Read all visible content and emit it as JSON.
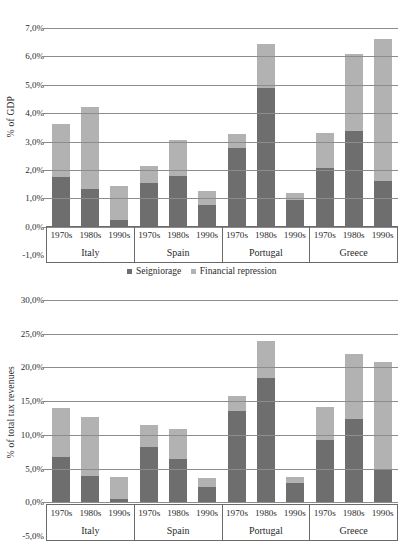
{
  "legend": {
    "items": [
      {
        "label": "Seigniorage",
        "color": "#6e6e6e",
        "key": "seigniorage"
      },
      {
        "label": "Financial repression",
        "color": "#b2b2b2",
        "key": "financial_repression"
      }
    ]
  },
  "axis_groups": {
    "countries": [
      "Italy",
      "Spain",
      "Portugal",
      "Greece"
    ],
    "periods": [
      "1970s",
      "1980s",
      "1990s"
    ]
  },
  "chart_data": [
    {
      "id": "gdp-chart",
      "type": "bar",
      "stacked": true,
      "title": "",
      "xlabel": "",
      "ylabel": "% of GDP",
      "ylim": [
        -1.0,
        7.0
      ],
      "ytick_step": 1.0,
      "ytick_labels": [
        "7,0%",
        "6,0%",
        "5,0%",
        "4,0%",
        "3,0%",
        "2,0%",
        "1,0%",
        "0,0%",
        "-1,0%"
      ],
      "ytick_values": [
        7.0,
        6.0,
        5.0,
        4.0,
        3.0,
        2.0,
        1.0,
        0.0,
        -1.0
      ],
      "grid": true,
      "legend_position": "bottom",
      "categories": [
        "Italy 1970s",
        "Italy 1980s",
        "Italy 1990s",
        "Spain 1970s",
        "Spain 1980s",
        "Spain 1990s",
        "Portugal 1970s",
        "Portugal 1980s",
        "Portugal 1990s",
        "Greece 1970s",
        "Greece 1980s",
        "Greece 1990s"
      ],
      "series": [
        {
          "name": "Seigniorage",
          "color": "#6e6e6e",
          "values": [
            1.75,
            1.32,
            0.22,
            1.55,
            1.77,
            0.76,
            2.78,
            4.9,
            1.18,
            2.08,
            3.38,
            1.6
          ]
        },
        {
          "name": "Financial repression",
          "color": "#b2b2b2",
          "values": [
            1.87,
            2.88,
            1.2,
            0.58,
            1.28,
            0.48,
            0.5,
            1.52,
            -0.25,
            1.22,
            2.7,
            5.0
          ]
        }
      ],
      "totals": [
        3.62,
        4.2,
        1.42,
        2.13,
        3.05,
        1.24,
        3.28,
        6.42,
        0.93,
        3.3,
        6.08,
        6.6
      ]
    },
    {
      "id": "tax-revenues-chart",
      "type": "bar",
      "stacked": true,
      "title": "",
      "xlabel": "",
      "ylabel": "% of total tax revenues",
      "ylim": [
        -5.0,
        30.0
      ],
      "ytick_step": 5.0,
      "ytick_labels": [
        "30,0%",
        "25,0%",
        "20,0%",
        "15,0%",
        "10,0%",
        "5,0%",
        "0,0%",
        "-5,0%"
      ],
      "ytick_values": [
        30.0,
        25.0,
        20.0,
        15.0,
        10.0,
        5.0,
        0.0,
        -5.0
      ],
      "grid": true,
      "legend_position": "none",
      "categories": [
        "Italy 1970s",
        "Italy 1980s",
        "Italy 1990s",
        "Spain 1970s",
        "Spain 1980s",
        "Spain 1990s",
        "Portugal 1970s",
        "Portugal 1980s",
        "Portugal 1990s",
        "Greece 1970s",
        "Greece 1980s",
        "Greece 1990s"
      ],
      "series": [
        {
          "name": "Seigniorage",
          "color": "#6e6e6e",
          "values": [
            6.7,
            3.9,
            0.5,
            8.2,
            6.4,
            2.2,
            13.6,
            18.4,
            3.8,
            9.2,
            12.4,
            5.0
          ]
        },
        {
          "name": "Financial repression",
          "color": "#b2b2b2",
          "values": [
            7.3,
            8.7,
            3.2,
            3.3,
            4.4,
            1.4,
            2.2,
            5.5,
            -1.0,
            5.0,
            9.6,
            15.8
          ]
        }
      ],
      "totals": [
        14.0,
        12.6,
        3.7,
        11.5,
        10.8,
        3.6,
        15.8,
        23.9,
        2.8,
        14.2,
        22.0,
        20.8
      ]
    }
  ]
}
